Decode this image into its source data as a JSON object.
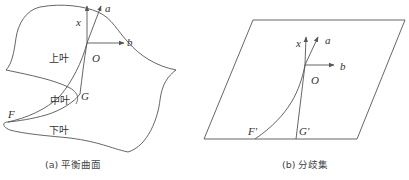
{
  "figure": {
    "panel_a": {
      "caption": "(a) 平衡曲面",
      "labels": {
        "x": "x",
        "a": "a",
        "b": "b",
        "O": "O",
        "G": "G",
        "F": "F",
        "upper_leaf": "上叶",
        "middle_leaf": "中叶",
        "lower_leaf": "下叶"
      }
    },
    "panel_b": {
      "caption": "(b) 分歧集",
      "labels": {
        "x": "x",
        "a": "a",
        "b": "b",
        "O": "O",
        "F_prime": "F'",
        "G_prime": "G'"
      }
    },
    "colors": {
      "line": "#555555",
      "text": "#333333",
      "background": "#ffffff"
    }
  }
}
